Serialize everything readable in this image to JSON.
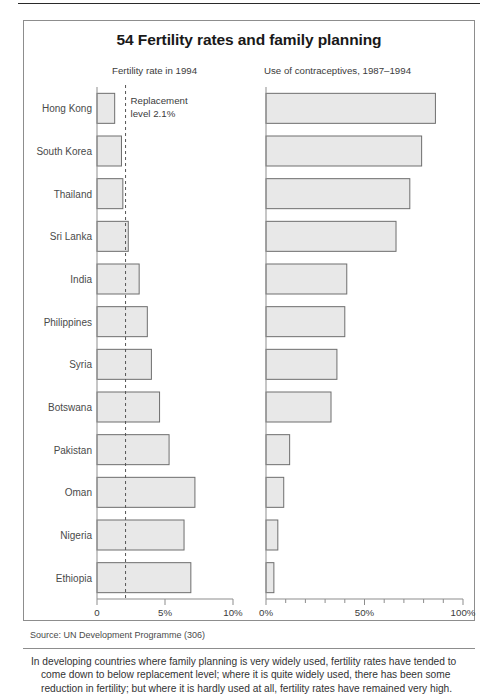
{
  "figure": {
    "title": "54 Fertility rates and family planning",
    "left_header": "Fertility rate in 1994",
    "right_header": "Use of contraceptives, 1987–1994",
    "annotation_line1": "Replacement",
    "annotation_line2": "level 2.1%",
    "source": "Source: UN Development Programme (306)",
    "caption_line1": "In developing countries where family planning is very widely used, fertility rates have tended to",
    "caption_line2": "come down to below replacement level; where it is quite widely used, there has been some",
    "caption_line3": "reduction in fertility; but where it is hardly used at all, fertility rates have remained very high.",
    "bar_fill": "#e8e8e8",
    "bar_stroke": "#6e6e6e",
    "axis_color": "#8d8d8d",
    "dash_color": "#555555"
  },
  "chart_data": {
    "type": "bar",
    "title": "54 Fertility rates and family planning",
    "orientation": "horizontal",
    "categories": [
      "Hong Kong",
      "South Korea",
      "Thailand",
      "Sri Lanka",
      "India",
      "Philippines",
      "Syria",
      "Botswana",
      "Pakistan",
      "Oman",
      "Nigeria",
      "Ethiopia"
    ],
    "panels": [
      {
        "name": "fertility",
        "title": "Fertility rate in 1994",
        "xlabel": "",
        "ylabel": "",
        "xlim": [
          0,
          10
        ],
        "xticks": [
          0,
          5,
          10
        ],
        "xticklabels": [
          "0",
          "5%",
          "10%"
        ],
        "grid": false,
        "values": [
          1.3,
          1.8,
          1.9,
          2.3,
          3.1,
          3.7,
          4.0,
          4.6,
          5.3,
          7.2,
          6.4,
          6.9
        ],
        "reference_line": {
          "value": 2.1,
          "label": "Replacement level 2.1%",
          "style": "dashed"
        }
      },
      {
        "name": "contraceptive-use",
        "title": "Use of contraceptives, 1987–1994",
        "xlabel": "",
        "ylabel": "",
        "xlim": [
          0,
          100
        ],
        "xticks": [
          0,
          10,
          20,
          30,
          40,
          50,
          60,
          70,
          80,
          90,
          100
        ],
        "xticklabels": [
          "0%",
          "",
          "",
          "",
          "",
          "50%",
          "",
          "",
          "",
          "",
          "100%"
        ],
        "grid": false,
        "values": [
          86,
          79,
          73,
          66,
          41,
          40,
          36,
          33,
          12,
          9,
          6,
          4
        ]
      }
    ],
    "legend": [],
    "annotations": [
      "Replacement level 2.1%"
    ]
  }
}
